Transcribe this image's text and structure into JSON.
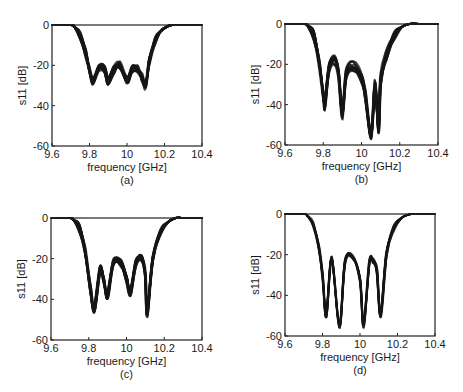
{
  "figure": {
    "panels": [
      "a",
      "b",
      "c",
      "d"
    ]
  },
  "chart_data": [
    {
      "type": "line",
      "panel_label": "(a)",
      "xlabel": "frequency [GHz]",
      "ylabel": "s11 [dB]",
      "xlim": [
        9.6,
        10.4
      ],
      "ylim": [
        -60,
        0
      ],
      "xticks": [
        "9.6",
        "9.8",
        "10",
        "10.2",
        "10.4"
      ],
      "yticks": [
        "0",
        "-20",
        "-40",
        "-60"
      ],
      "grid": false,
      "description": "Ensemble of many overlaid S11 responses; passband ripple around -20 to -30 dB",
      "x": [
        9.6,
        9.7,
        9.72,
        9.75,
        9.78,
        9.8,
        9.82,
        9.85,
        9.88,
        9.9,
        9.93,
        9.96,
        10.0,
        10.03,
        10.06,
        10.08,
        10.1,
        10.12,
        10.15,
        10.18,
        10.22,
        10.25,
        10.3,
        10.4
      ],
      "y": [
        0,
        0,
        -1,
        -5,
        -14,
        -22,
        -28,
        -21,
        -22,
        -28,
        -22,
        -20,
        -27,
        -22,
        -22,
        -26,
        -30,
        -18,
        -8,
        -3,
        -0.5,
        0,
        0,
        0
      ],
      "spread_db": 4
    },
    {
      "type": "line",
      "panel_label": "(b)",
      "xlabel": "frequency [GHz]",
      "ylabel": "s11 [dB]",
      "xlim": [
        9.6,
        10.4
      ],
      "ylim": [
        -60,
        0
      ],
      "xticks": [
        "9.6",
        "9.8",
        "10",
        "10.2",
        "10.4"
      ],
      "yticks": [
        "0",
        "-20",
        "-40",
        "-60"
      ],
      "grid": false,
      "description": "Ensemble of overlaid S11 responses with deeper reflection zeros",
      "x": [
        9.6,
        9.7,
        9.72,
        9.75,
        9.78,
        9.8,
        9.81,
        9.83,
        9.86,
        9.88,
        9.9,
        9.92,
        9.96,
        10.0,
        10.02,
        10.05,
        10.07,
        10.09,
        10.1,
        10.13,
        10.17,
        10.21,
        10.25,
        10.3,
        10.4
      ],
      "y": [
        0,
        0,
        -1,
        -6,
        -20,
        -35,
        -40,
        -22,
        -18,
        -25,
        -45,
        -25,
        -21,
        -27,
        -35,
        -55,
        -30,
        -52,
        -28,
        -15,
        -6,
        -1.5,
        0,
        0,
        0
      ],
      "spread_db": 5
    },
    {
      "type": "line",
      "panel_label": "(c)",
      "xlabel": "frequency [GHz]",
      "ylabel": "s11 [dB]",
      "xlim": [
        9.6,
        10.4
      ],
      "ylim": [
        -60,
        0
      ],
      "xticks": [
        "9.6",
        "9.8",
        "10",
        "10.2",
        "10.4"
      ],
      "yticks": [
        "0",
        "-20",
        "-40",
        "-60"
      ],
      "grid": false,
      "description": "Ensemble of overlaid S11 responses, tighter spread",
      "x": [
        9.6,
        9.7,
        9.72,
        9.75,
        9.78,
        9.81,
        9.83,
        9.86,
        9.88,
        9.9,
        9.93,
        9.97,
        10.0,
        10.02,
        10.05,
        10.08,
        10.1,
        10.11,
        10.14,
        10.18,
        10.22,
        10.26,
        10.3,
        10.4
      ],
      "y": [
        0,
        0,
        -1,
        -5,
        -16,
        -35,
        -45,
        -25,
        -30,
        -38,
        -22,
        -22,
        -30,
        -37,
        -22,
        -20,
        -28,
        -47,
        -20,
        -7,
        -2,
        0,
        0,
        0
      ],
      "spread_db": 3.5
    },
    {
      "type": "line",
      "panel_label": "(d)",
      "xlabel": "frequency [GHz]",
      "ylabel": "s11 [dB]",
      "xlim": [
        9.6,
        10.4
      ],
      "ylim": [
        -60,
        0
      ],
      "xticks": [
        "9.6",
        "9.8",
        "10",
        "10.2",
        "10.4"
      ],
      "yticks": [
        "0",
        "-20",
        "-40",
        "-60"
      ],
      "grid": false,
      "description": "Ensemble of overlaid S11 responses, narrow spread with four deep reflection zeros",
      "x": [
        9.6,
        9.7,
        9.72,
        9.75,
        9.78,
        9.8,
        9.82,
        9.85,
        9.89,
        9.92,
        9.96,
        10.0,
        10.02,
        10.05,
        10.07,
        10.09,
        10.11,
        10.14,
        10.18,
        10.22,
        10.26,
        10.3,
        10.4
      ],
      "y": [
        0,
        0,
        -1,
        -5,
        -16,
        -30,
        -50,
        -22,
        -55,
        -24,
        -21,
        -32,
        -55,
        -24,
        -23,
        -28,
        -50,
        -20,
        -7,
        -2,
        -0.3,
        0,
        0
      ],
      "spread_db": 2.5
    }
  ]
}
